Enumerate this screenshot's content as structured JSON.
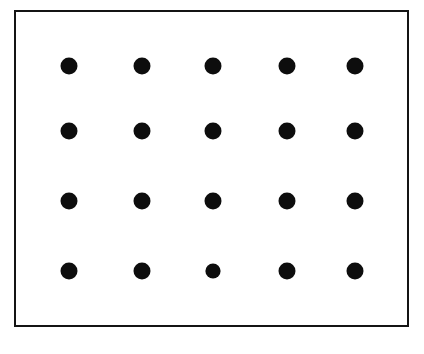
{
  "figure": {
    "name": "dot-array-figure",
    "canvas": {
      "width": 424,
      "height": 354,
      "background_color": "#ffffff"
    },
    "frame": {
      "name": "frame-rect",
      "x": 15,
      "y": 11,
      "width": 393,
      "height": 315,
      "stroke_color": "#141414",
      "stroke_width": 2.2,
      "fill": "none"
    },
    "dots": {
      "color": "#0d0d0d",
      "default_radius": 8.5,
      "rows": 4,
      "columns": 5,
      "count": 20,
      "column_centers_x": [
        69,
        142,
        213,
        287,
        355
      ],
      "row_centers_y": [
        66,
        131,
        201,
        271
      ]
    }
  },
  "chart_data": {
    "type": "scatter",
    "title": "",
    "subtitle": "",
    "xlabel": "",
    "ylabel": "",
    "grid": false,
    "legend": null,
    "axis_ticks": [],
    "annotations": [],
    "xlim": [
      15,
      408
    ],
    "ylim": [
      11,
      326
    ],
    "series": [
      {
        "name": "dot-grid",
        "marker": "filled-circle",
        "color": "#0d0d0d",
        "points": [
          {
            "id": "r1c1",
            "row": 1,
            "col": 1,
            "x": 69,
            "y": 66,
            "r": 8.5
          },
          {
            "id": "r1c2",
            "row": 1,
            "col": 2,
            "x": 142,
            "y": 66,
            "r": 8.5
          },
          {
            "id": "r1c3",
            "row": 1,
            "col": 3,
            "x": 213,
            "y": 66,
            "r": 8.5
          },
          {
            "id": "r1c4",
            "row": 1,
            "col": 4,
            "x": 287,
            "y": 66,
            "r": 8.5
          },
          {
            "id": "r1c5",
            "row": 1,
            "col": 5,
            "x": 355,
            "y": 66,
            "r": 8.5
          },
          {
            "id": "r2c1",
            "row": 2,
            "col": 1,
            "x": 69,
            "y": 131,
            "r": 8.5
          },
          {
            "id": "r2c2",
            "row": 2,
            "col": 2,
            "x": 142,
            "y": 131,
            "r": 8.5
          },
          {
            "id": "r2c3",
            "row": 2,
            "col": 3,
            "x": 213,
            "y": 131,
            "r": 8.5
          },
          {
            "id": "r2c4",
            "row": 2,
            "col": 4,
            "x": 287,
            "y": 131,
            "r": 8.5
          },
          {
            "id": "r2c5",
            "row": 2,
            "col": 5,
            "x": 355,
            "y": 131,
            "r": 8.5
          },
          {
            "id": "r3c1",
            "row": 3,
            "col": 1,
            "x": 69,
            "y": 201,
            "r": 8.5
          },
          {
            "id": "r3c2",
            "row": 3,
            "col": 2,
            "x": 142,
            "y": 201,
            "r": 8.5
          },
          {
            "id": "r3c3",
            "row": 3,
            "col": 3,
            "x": 213,
            "y": 201,
            "r": 8.5
          },
          {
            "id": "r3c4",
            "row": 3,
            "col": 4,
            "x": 287,
            "y": 201,
            "r": 8.5
          },
          {
            "id": "r3c5",
            "row": 3,
            "col": 5,
            "x": 355,
            "y": 201,
            "r": 8.5
          },
          {
            "id": "r4c1",
            "row": 4,
            "col": 1,
            "x": 69,
            "y": 271,
            "r": 8.5
          },
          {
            "id": "r4c2",
            "row": 4,
            "col": 2,
            "x": 142,
            "y": 271,
            "r": 8.5
          },
          {
            "id": "r4c3",
            "row": 4,
            "col": 3,
            "x": 213,
            "y": 271,
            "r": 7.6
          },
          {
            "id": "r4c4",
            "row": 4,
            "col": 4,
            "x": 287,
            "y": 271,
            "r": 8.5
          },
          {
            "id": "r4c5",
            "row": 4,
            "col": 5,
            "x": 355,
            "y": 271,
            "r": 8.5
          }
        ]
      }
    ]
  }
}
